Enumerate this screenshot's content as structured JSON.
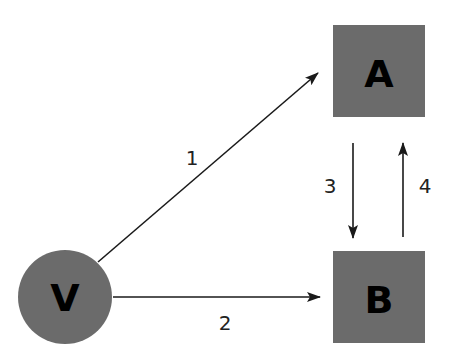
{
  "colors": {
    "node_fill": "#6b6b6b",
    "edge": "#1a1a1a",
    "label": "#000000",
    "background": "#ffffff"
  },
  "nodes": [
    {
      "id": "V",
      "label": "V",
      "shape": "circle"
    },
    {
      "id": "A",
      "label": "A",
      "shape": "square"
    },
    {
      "id": "B",
      "label": "B",
      "shape": "square"
    }
  ],
  "edges": [
    {
      "from": "V",
      "to": "A",
      "label": "1"
    },
    {
      "from": "V",
      "to": "B",
      "label": "2"
    },
    {
      "from": "A",
      "to": "B",
      "label": "3"
    },
    {
      "from": "B",
      "to": "A",
      "label": "4"
    }
  ]
}
